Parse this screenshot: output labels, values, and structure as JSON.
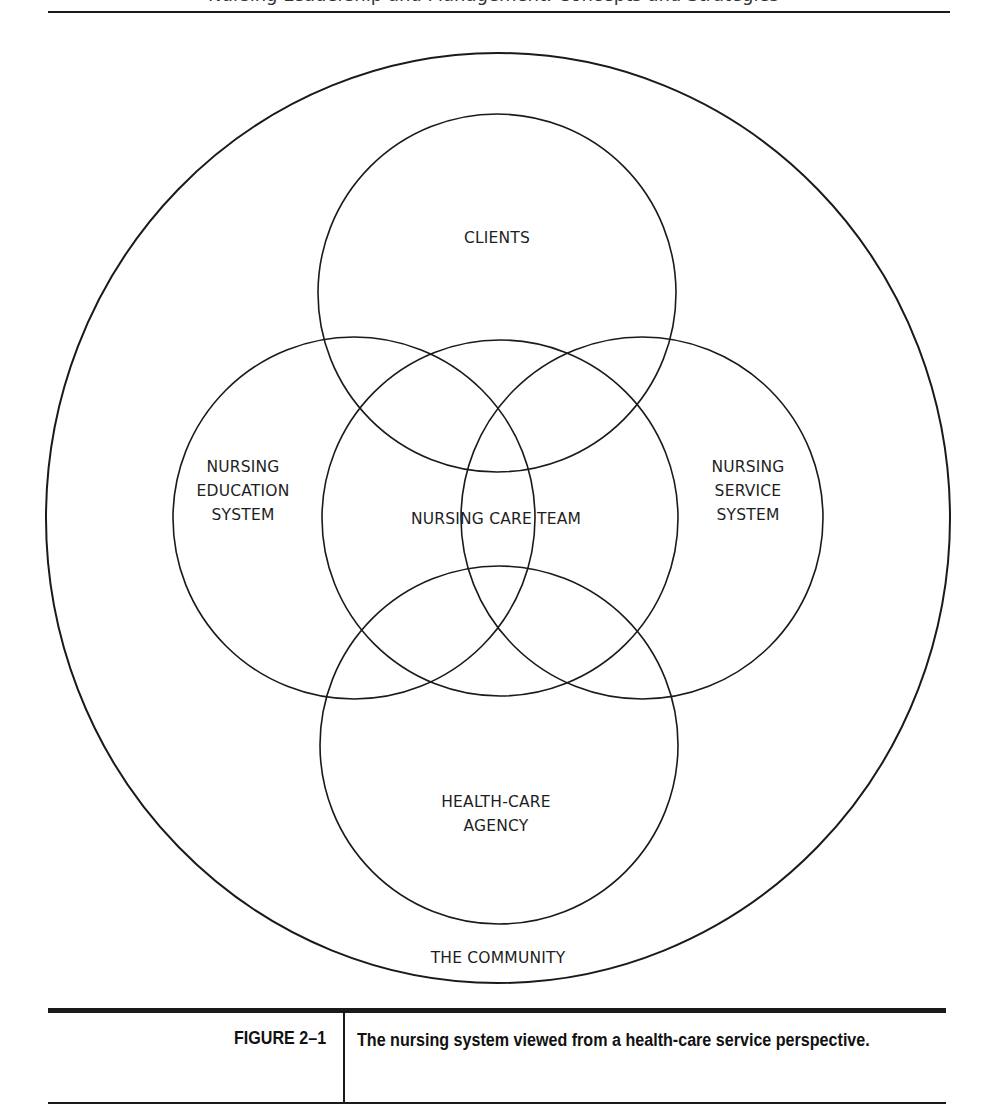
{
  "page": {
    "running_header": "Nursing Leadership and Management: Concepts and Strategies"
  },
  "diagram": {
    "type": "nested-venn",
    "outer": {
      "label": "THE COMMUNITY",
      "cx": 498,
      "cy": 518,
      "rx": 452,
      "ry": 465
    },
    "circles": [
      {
        "id": "clients",
        "lines": [
          "CLIENTS"
        ],
        "cx": 497,
        "cy": 293,
        "r": 179,
        "label_x": 497,
        "label_y": 226
      },
      {
        "id": "nursing-education-system",
        "lines": [
          "NURSING",
          "EDUCATION",
          "SYSTEM"
        ],
        "cx": 354,
        "cy": 518,
        "r": 181,
        "label_x": 243,
        "label_y": 455
      },
      {
        "id": "nursing-care-team",
        "lines": [
          "NURSING CARE TEAM"
        ],
        "cx": 500,
        "cy": 518,
        "r": 178,
        "label_x": 496,
        "label_y": 507
      },
      {
        "id": "nursing-service-system",
        "lines": [
          "NURSING",
          "SERVICE",
          "SYSTEM"
        ],
        "cx": 642,
        "cy": 518,
        "r": 181,
        "label_x": 748,
        "label_y": 455
      },
      {
        "id": "health-care-agency",
        "lines": [
          "HEALTH-CARE",
          "AGENCY"
        ],
        "cx": 499,
        "cy": 745,
        "r": 179,
        "label_x": 496,
        "label_y": 790
      }
    ],
    "community_label": "THE COMMUNITY",
    "community_label_x": 498,
    "community_label_y": 946,
    "stroke_color": "#1a1a1a"
  },
  "caption": {
    "figure_number": "FIGURE 2–1",
    "text": "The nursing system viewed from a health-care service perspective."
  }
}
